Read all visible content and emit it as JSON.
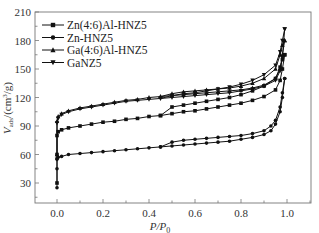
{
  "chart_data": {
    "type": "line",
    "title": "",
    "xlabel": "P/P0",
    "ylabel": "Vads/(cm3/g)",
    "xlim": [
      -0.1,
      1.1
    ],
    "ylim": [
      10,
      210
    ],
    "xticks": [
      "0.0",
      "0.2",
      "0.4",
      "0.6",
      "0.8",
      "1.0"
    ],
    "yticks": [
      "30",
      "60",
      "90",
      "120",
      "150",
      "180",
      "210"
    ],
    "grid": false,
    "legend_position": "upper-left",
    "series": [
      {
        "name": "Zn(4:6)Al-HNZ5",
        "marker": "square",
        "adsorption": {
          "x": [
            0.0,
            0.0,
            0.0,
            0.005,
            0.02,
            0.05,
            0.1,
            0.15,
            0.2,
            0.25,
            0.3,
            0.35,
            0.4,
            0.45,
            0.5,
            0.55,
            0.6,
            0.65,
            0.7,
            0.75,
            0.8,
            0.85,
            0.9,
            0.95,
            0.97,
            0.98,
            0.99
          ],
          "y": [
            30,
            60,
            80,
            84,
            86,
            88,
            90,
            92,
            94,
            95,
            97,
            98,
            100,
            101,
            103,
            105,
            106,
            108,
            110,
            112,
            114,
            117,
            121,
            128,
            138,
            150,
            165
          ]
        },
        "desorption": {
          "x": [
            0.99,
            0.98,
            0.97,
            0.95,
            0.9,
            0.85,
            0.8,
            0.75,
            0.7,
            0.65,
            0.6,
            0.55,
            0.5,
            0.45
          ],
          "y": [
            165,
            160,
            152,
            140,
            132,
            127,
            123,
            120,
            118,
            116,
            114,
            112,
            110,
            101
          ]
        }
      },
      {
        "name": "Zn-HNZ5",
        "marker": "circle",
        "adsorption": {
          "x": [
            0.0,
            0.0,
            0.0,
            0.005,
            0.02,
            0.05,
            0.1,
            0.15,
            0.2,
            0.25,
            0.3,
            0.35,
            0.4,
            0.45,
            0.5,
            0.55,
            0.6,
            0.65,
            0.7,
            0.75,
            0.8,
            0.85,
            0.9,
            0.93,
            0.95,
            0.97,
            0.98,
            0.99
          ],
          "y": [
            25,
            45,
            55,
            57,
            58,
            60,
            61,
            62,
            63,
            64,
            65,
            66,
            67,
            68,
            69,
            70,
            71,
            72,
            73,
            74,
            76,
            78,
            81,
            85,
            92,
            105,
            120,
            140
          ]
        },
        "desorption": {
          "x": [
            0.99,
            0.98,
            0.97,
            0.95,
            0.93,
            0.9,
            0.85,
            0.8,
            0.75,
            0.7,
            0.65,
            0.6,
            0.55,
            0.5,
            0.45
          ],
          "y": [
            140,
            125,
            110,
            96,
            90,
            85,
            82,
            80,
            79,
            78,
            77,
            76,
            75,
            73,
            68
          ]
        }
      },
      {
        "name": "Ga(4:6)Al-HNZ5",
        "marker": "triangle-up",
        "adsorption": {
          "x": [
            0.0,
            0.0,
            0.005,
            0.02,
            0.05,
            0.1,
            0.15,
            0.2,
            0.25,
            0.3,
            0.35,
            0.4,
            0.45,
            0.5,
            0.55,
            0.6,
            0.65,
            0.7,
            0.75,
            0.8,
            0.85,
            0.9,
            0.95,
            0.97,
            0.98,
            0.99
          ],
          "y": [
            60,
            95,
            100,
            103,
            106,
            109,
            111,
            113,
            115,
            117,
            118,
            120,
            121,
            122,
            123,
            124,
            125,
            126,
            127,
            128,
            130,
            133,
            140,
            150,
            165,
            180
          ]
        },
        "desorption": {
          "x": [
            0.99,
            0.98,
            0.97,
            0.95,
            0.9,
            0.85,
            0.8,
            0.75,
            0.7,
            0.65,
            0.6,
            0.55,
            0.5,
            0.45
          ],
          "y": [
            180,
            175,
            165,
            150,
            140,
            135,
            132,
            130,
            129,
            128,
            127,
            126,
            124,
            121
          ]
        }
      },
      {
        "name": "GaNZ5",
        "marker": "triangle-down",
        "adsorption": {
          "x": [
            0.0,
            0.0,
            0.005,
            0.02,
            0.05,
            0.1,
            0.15,
            0.2,
            0.25,
            0.3,
            0.35,
            0.4,
            0.45,
            0.5,
            0.55,
            0.6,
            0.65,
            0.7,
            0.75,
            0.8,
            0.85,
            0.9,
            0.95,
            0.97,
            0.98,
            0.99
          ],
          "y": [
            55,
            93,
            98,
            102,
            105,
            108,
            110,
            112,
            114,
            116,
            117,
            118,
            119,
            120,
            121,
            122,
            123,
            124,
            125,
            127,
            129,
            132,
            138,
            148,
            162,
            192
          ]
        },
        "desorption": {
          "x": [
            0.99,
            0.98,
            0.97,
            0.95,
            0.9,
            0.85,
            0.8,
            0.75,
            0.7,
            0.65,
            0.6,
            0.55,
            0.5,
            0.45
          ],
          "y": [
            192,
            180,
            168,
            154,
            144,
            138,
            134,
            131,
            129,
            127,
            125,
            124,
            122,
            119
          ]
        }
      }
    ]
  },
  "legend": {
    "items": [
      "Zn(4:6)Al-HNZ5",
      "Zn-HNZ5",
      "Ga(4:6)Al-HNZ5",
      "GaNZ5"
    ]
  },
  "axes": {
    "x_title_main": "P/P",
    "x_title_sub": "0",
    "y_title_main": "V",
    "y_title_sub": "ads",
    "y_title_unit": "/(cm",
    "y_title_sup": "3",
    "y_title_end": "/g)"
  },
  "colors": {
    "series": "#111111",
    "axis": "#666666",
    "text": "#333333"
  }
}
